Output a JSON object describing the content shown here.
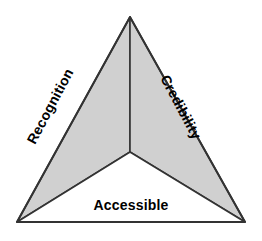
{
  "diagram": {
    "type": "segmented-triangle",
    "title": "",
    "background_color": "#ffffff",
    "outline_color": "#333333",
    "outline_width": 2,
    "divider_color": "#333333",
    "divider_width": 1.6,
    "geometry": {
      "apex": [
        130,
        17
      ],
      "bottom_left": [
        17,
        222
      ],
      "bottom_right": [
        245,
        222
      ],
      "center": [
        130,
        152
      ]
    },
    "wedges": [
      {
        "id": "recognition",
        "label": "Recognition",
        "fill_color": "#d0d0d0",
        "text_color": "#000000",
        "rotation_deg": -62,
        "position": "left"
      },
      {
        "id": "credibility",
        "label": "Credibility",
        "fill_color": "#d0d0d0",
        "text_color": "#000000",
        "rotation_deg": 62,
        "position": "right"
      },
      {
        "id": "accessible",
        "label": "Accessible",
        "fill_color": "#ffffff",
        "text_color": "#000000",
        "rotation_deg": 0,
        "position": "bottom"
      }
    ]
  }
}
